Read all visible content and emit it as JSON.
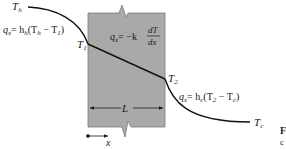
{
  "diagram": {
    "wall": {
      "fill_color": "#a9a9a9",
      "edge_color": "#7a7a7a",
      "thickness_label": "L",
      "conduction_equation": {
        "lhs": "q",
        "lhs_sub": "x",
        "rhs_prefix": "= −k",
        "fraction_num": "dT",
        "fraction_den": "dx"
      }
    },
    "hot_side": {
      "fluid_temp_label": "T",
      "fluid_temp_sub": "h",
      "surface_temp_label": "T",
      "surface_temp_sub": "1",
      "convection_equation": {
        "lhs": "q",
        "lhs_sub": "x",
        "eq": "= h",
        "h_sub": "h",
        "paren": "(T",
        "t_sub_a": "h",
        "minus": " − T",
        "t_sub_b": "1",
        "close": ")"
      }
    },
    "cold_side": {
      "fluid_temp_label": "T",
      "fluid_temp_sub": "c",
      "surface_temp_label": "T",
      "surface_temp_sub": "2",
      "convection_equation": {
        "lhs": "q",
        "lhs_sub": "x",
        "eq": "= h",
        "h_sub": "c",
        "paren": "(T",
        "t_sub_a": "2",
        "minus": " − T",
        "t_sub_b": "c",
        "close": ")"
      }
    },
    "axis": {
      "label": "x"
    },
    "clipped_caption": {
      "line1": "F",
      "line2": "c"
    }
  }
}
